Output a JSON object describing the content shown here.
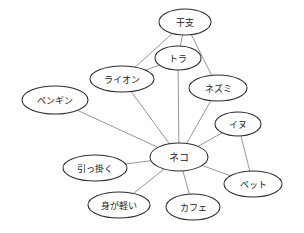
{
  "diagram": {
    "type": "undirected-concept-graph",
    "background_color": "#ffffff",
    "node_fill_color": "#ffffff",
    "node_stroke_color": "#2c2c2c",
    "edge_color": "#8a8a8a",
    "label_color": "#1a1a1a",
    "nodes": [
      {
        "id": "eto",
        "label": "干支",
        "cx": 185,
        "cy": 22,
        "rx": 26,
        "ry": 13,
        "font_size": 9
      },
      {
        "id": "tora",
        "label": "トラ",
        "cx": 178,
        "cy": 58,
        "rx": 23,
        "ry": 12,
        "font_size": 9
      },
      {
        "id": "raion",
        "label": "ライオン",
        "cx": 122,
        "cy": 79,
        "rx": 32,
        "ry": 13,
        "font_size": 9
      },
      {
        "id": "nezumi",
        "label": "ネズミ",
        "cx": 218,
        "cy": 88,
        "rx": 29,
        "ry": 13,
        "font_size": 9
      },
      {
        "id": "pengin",
        "label": "ペンギン",
        "cx": 55,
        "cy": 100,
        "rx": 33,
        "ry": 14,
        "font_size": 9
      },
      {
        "id": "inu",
        "label": "イヌ",
        "cx": 238,
        "cy": 124,
        "rx": 23,
        "ry": 12,
        "font_size": 9
      },
      {
        "id": "neko",
        "label": "ネコ",
        "cx": 179,
        "cy": 157,
        "rx": 29,
        "ry": 14,
        "font_size": 10
      },
      {
        "id": "hikkaku",
        "label": "引っ掛く",
        "cx": 95,
        "cy": 168,
        "rx": 32,
        "ry": 13,
        "font_size": 9
      },
      {
        "id": "petto",
        "label": "ペット",
        "cx": 253,
        "cy": 184,
        "rx": 29,
        "ry": 13,
        "font_size": 9
      },
      {
        "id": "migakarui",
        "label": "身が軽い",
        "cx": 119,
        "cy": 205,
        "rx": 31,
        "ry": 13,
        "font_size": 9
      },
      {
        "id": "kafe",
        "label": "カフェ",
        "cx": 193,
        "cy": 207,
        "rx": 27,
        "ry": 13,
        "font_size": 9
      }
    ],
    "edges": [
      {
        "from": "eto",
        "to": "raion"
      },
      {
        "from": "eto",
        "to": "tora"
      },
      {
        "from": "eto",
        "to": "nezumi"
      },
      {
        "from": "tora",
        "to": "raion"
      },
      {
        "from": "tora",
        "to": "neko"
      },
      {
        "from": "raion",
        "to": "neko"
      },
      {
        "from": "nezumi",
        "to": "neko"
      },
      {
        "from": "pengin",
        "to": "neko"
      },
      {
        "from": "inu",
        "to": "neko"
      },
      {
        "from": "inu",
        "to": "petto"
      },
      {
        "from": "neko",
        "to": "petto"
      },
      {
        "from": "neko",
        "to": "hikkaku"
      },
      {
        "from": "neko",
        "to": "migakarui"
      },
      {
        "from": "neko",
        "to": "kafe"
      }
    ]
  }
}
